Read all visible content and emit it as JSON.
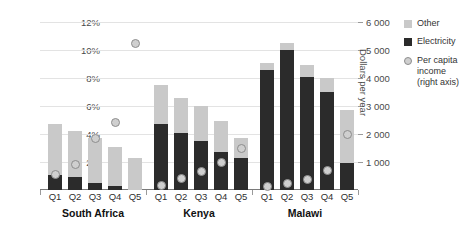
{
  "chart_data": {
    "type": "bar",
    "title": "",
    "subtitle": "",
    "xlabel": "",
    "ylabel": "",
    "grid": true,
    "legend_position": "right",
    "categories": [
      "Q1",
      "Q2",
      "Q3",
      "Q4",
      "Q5"
    ],
    "groups": [
      "South Africa",
      "Kenya",
      "Malawi"
    ],
    "left_axis": {
      "label": "",
      "ticks": [
        "2%",
        "4%",
        "6%",
        "8%",
        "10%",
        "12%"
      ],
      "tick_values": [
        2,
        4,
        6,
        8,
        10,
        12
      ],
      "min": 0,
      "max": 12,
      "unit": "percent"
    },
    "right_axis": {
      "label": "Dollars per year",
      "ticks": [
        "1 000",
        "2 000",
        "3 000",
        "4 000",
        "5 000",
        "6 000"
      ],
      "tick_values": [
        1000,
        2000,
        3000,
        4000,
        5000,
        6000
      ],
      "min": 0,
      "max": 6000
    },
    "series": [
      {
        "name": "Electricity",
        "color": "#2b2b2b",
        "axis": "left",
        "stack": "share",
        "values_by_group": {
          "South Africa": [
            1.1,
            0.9,
            0.5,
            0.3,
            0.0
          ],
          "Kenya": [
            4.7,
            4.1,
            3.5,
            2.7,
            2.3
          ],
          "Malawi": [
            8.6,
            10.0,
            8.1,
            7.0,
            1.9
          ]
        }
      },
      {
        "name": "Other",
        "color": "#c9c9c9",
        "axis": "left",
        "stack": "share",
        "values_by_group": {
          "South Africa": [
            3.6,
            3.3,
            3.2,
            2.8,
            2.3
          ],
          "Kenya": [
            2.8,
            2.5,
            2.5,
            2.2,
            1.4
          ],
          "Malawi": [
            0.5,
            0.5,
            0.8,
            1.0,
            3.8
          ]
        }
      },
      {
        "name": "Per capita income (right axis)",
        "color": "#cfcfcf",
        "axis": "right",
        "type": "scatter",
        "values_by_group": {
          "South Africa": [
            560,
            900,
            1850,
            2400,
            5250
          ],
          "Kenya": [
            170,
            400,
            650,
            1000,
            1500
          ],
          "Malawi": [
            130,
            250,
            380,
            700,
            2000
          ]
        }
      }
    ]
  },
  "legend": {
    "items": [
      {
        "label": "Other",
        "swatch": "square-light"
      },
      {
        "label": "Electricity",
        "swatch": "square-dark"
      },
      {
        "label": "Per capita income (right axis)",
        "swatch": "circle-marker"
      }
    ]
  },
  "axes": {
    "right_title": "Dollars per year"
  }
}
